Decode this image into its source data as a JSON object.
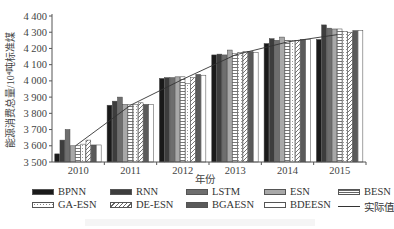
{
  "chart_data": {
    "type": "bar",
    "title": "",
    "xlabel": "年份",
    "ylabel": "能源消费总量/10⁴吨标准煤",
    "ylim": [
      3500,
      4400
    ],
    "yticks": [
      3500,
      3600,
      3700,
      3800,
      3900,
      4000,
      4100,
      4200,
      4300,
      4400
    ],
    "ytick_labels": [
      "3 500",
      "3 600",
      "3 700",
      "3 800",
      "3 900",
      "4 000",
      "4 100",
      "4 200",
      "4 300",
      "4 400"
    ],
    "categories": [
      "2010",
      "2011",
      "2012",
      "2013",
      "2014",
      "2015"
    ],
    "grid": false,
    "legend_position": "bottom",
    "series": [
      {
        "name": "BPNN",
        "kind": "bar",
        "values": [
          3550,
          3850,
          4015,
          4160,
          4230,
          4255
        ]
      },
      {
        "name": "RNN",
        "kind": "bar",
        "values": [
          3635,
          3875,
          4020,
          4165,
          4260,
          4345
        ]
      },
      {
        "name": "LSTM",
        "kind": "bar",
        "values": [
          3700,
          3900,
          4020,
          4160,
          4250,
          4325
        ]
      },
      {
        "name": "ESN",
        "kind": "bar",
        "values": [
          3600,
          3855,
          4025,
          4190,
          4270,
          4320
        ]
      },
      {
        "name": "BESN",
        "kind": "bar",
        "values": [
          3600,
          3855,
          4025,
          4170,
          4250,
          4320
        ]
      },
      {
        "name": "GA-ESN",
        "kind": "bar",
        "values": [
          3610,
          3855,
          3985,
          4175,
          4250,
          4305
        ]
      },
      {
        "name": "DE-ESN",
        "kind": "bar",
        "values": [
          3635,
          3865,
          4020,
          4180,
          4250,
          4300
        ]
      },
      {
        "name": "BGAESN",
        "kind": "bar",
        "values": [
          3605,
          3855,
          4040,
          4180,
          4255,
          4310
        ]
      },
      {
        "name": "BDEESN",
        "kind": "bar",
        "values": [
          3605,
          3855,
          4035,
          4175,
          4255,
          4310
        ]
      },
      {
        "name": "实际值",
        "kind": "line",
        "values": [
          3600,
          3850,
          4010,
          4160,
          4240,
          4285
        ]
      }
    ]
  },
  "legend": {
    "items": [
      {
        "label": "BPNN",
        "fill": "#1a1a1a",
        "pattern": "solid"
      },
      {
        "label": "RNN",
        "fill": "#3d3d3d",
        "pattern": "solid"
      },
      {
        "label": "LSTM",
        "fill": "#6e6e6e",
        "pattern": "solid"
      },
      {
        "label": "ESN",
        "fill": "#a8a8a8",
        "pattern": "solid"
      },
      {
        "label": "BESN",
        "fill": "#ffffff",
        "pattern": "hlines"
      },
      {
        "label": "GA-ESN",
        "fill": "#ffffff",
        "pattern": "dots"
      },
      {
        "label": "DE-ESN",
        "fill": "#ffffff",
        "pattern": "diag"
      },
      {
        "label": "BGAESN",
        "fill": "#5a5a5a",
        "pattern": "solid"
      },
      {
        "label": "BDEESN",
        "fill": "#ffffff",
        "pattern": "solid"
      },
      {
        "label": "实际值",
        "fill": "#333333",
        "pattern": "line"
      }
    ]
  }
}
